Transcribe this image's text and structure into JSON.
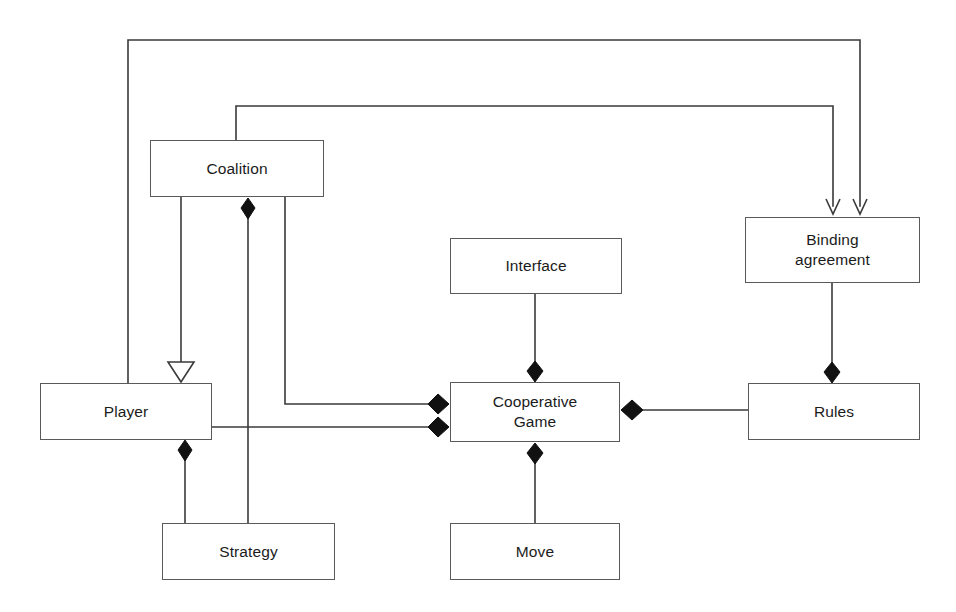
{
  "diagram": {
    "type": "uml-class-diagram",
    "canvas": {
      "width": 956,
      "height": 612
    },
    "style": {
      "background": "#ffffff",
      "box_stroke": "#5a5a5a",
      "line_stroke": "#3a3a3a",
      "text_color": "#1b1b1b",
      "diamond_fill": "#111111",
      "triangle_fill": "#ffffff"
    },
    "nodes": [
      {
        "id": "coalition",
        "label": "Coalition",
        "x": 150,
        "y": 140,
        "w": 174,
        "h": 57
      },
      {
        "id": "interface",
        "label": "Interface",
        "x": 450,
        "y": 238,
        "w": 172,
        "h": 56
      },
      {
        "id": "binding_agreement",
        "label": "Binding\nagreement",
        "x": 745,
        "y": 217,
        "w": 175,
        "h": 66
      },
      {
        "id": "player",
        "label": "Player",
        "x": 40,
        "y": 383,
        "w": 172,
        "h": 57
      },
      {
        "id": "cooperative_game",
        "label": "Cooperative\nGame",
        "x": 450,
        "y": 382,
        "w": 170,
        "h": 60
      },
      {
        "id": "rules",
        "label": "Rules",
        "x": 748,
        "y": 383,
        "w": 172,
        "h": 57
      },
      {
        "id": "strategy",
        "label": "Strategy",
        "x": 162,
        "y": 523,
        "w": 173,
        "h": 57
      },
      {
        "id": "move",
        "label": "Move",
        "x": 450,
        "y": 523,
        "w": 170,
        "h": 57
      }
    ],
    "edges": [
      {
        "id": "player-to-binding-agreement",
        "from": "player",
        "to": "binding_agreement",
        "kind": "dependency",
        "end_marker": "open-arrow"
      },
      {
        "id": "coalition-to-binding-agreement",
        "from": "coalition",
        "to": "binding_agreement",
        "kind": "dependency",
        "end_marker": "open-arrow"
      },
      {
        "id": "coalition-to-player",
        "from": "coalition",
        "to": "player",
        "kind": "generalization",
        "end_marker": "hollow-triangle"
      },
      {
        "id": "coalition-to-strategy",
        "from": "coalition",
        "to": "strategy",
        "kind": "composition",
        "end_marker": "filled-diamond"
      },
      {
        "id": "coalition-to-cooperative-game",
        "from": "coalition",
        "to": "cooperative_game",
        "kind": "composition",
        "end_marker": "filled-diamond"
      },
      {
        "id": "player-to-cooperative-game",
        "from": "player",
        "to": "cooperative_game",
        "kind": "composition",
        "end_marker": "filled-diamond"
      },
      {
        "id": "player-to-strategy",
        "from": "player",
        "to": "strategy",
        "kind": "composition",
        "end_marker": "filled-diamond"
      },
      {
        "id": "interface-to-cooperative-game",
        "from": "interface",
        "to": "cooperative_game",
        "kind": "composition",
        "end_marker": "filled-diamond"
      },
      {
        "id": "rules-to-cooperative-game",
        "from": "rules",
        "to": "cooperative_game",
        "kind": "composition",
        "end_marker": "filled-diamond"
      },
      {
        "id": "binding-agreement-to-rules",
        "from": "binding_agreement",
        "to": "rules",
        "kind": "composition",
        "end_marker": "filled-diamond"
      },
      {
        "id": "cooperative-game-to-move",
        "from": "cooperative_game",
        "to": "move",
        "kind": "composition",
        "end_marker": "filled-diamond"
      }
    ]
  }
}
